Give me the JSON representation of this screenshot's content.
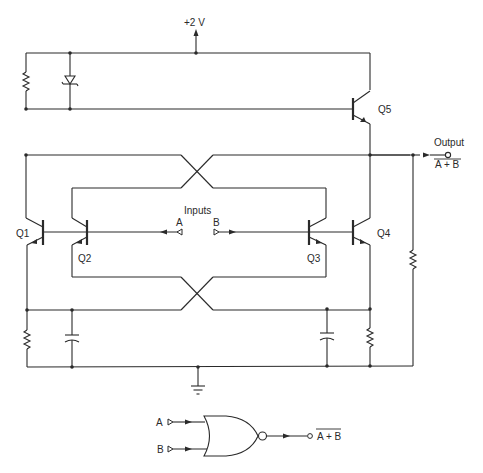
{
  "diagram": {
    "type": "circuit-schematic",
    "supply": {
      "label": "+2 V"
    },
    "transistors": [
      {
        "id": "q1",
        "label": "Q1"
      },
      {
        "id": "q2",
        "label": "Q2"
      },
      {
        "id": "q3",
        "label": "Q3"
      },
      {
        "id": "q4",
        "label": "Q4"
      },
      {
        "id": "q5",
        "label": "Q5"
      }
    ],
    "inputs": {
      "title": "Inputs",
      "a_label": "A",
      "b_label": "B"
    },
    "output": {
      "title": "Output",
      "expression": "A + B",
      "overbar": true
    },
    "components": {
      "resistors": 4,
      "capacitors": 2,
      "diodes": 1,
      "ground": 1
    },
    "logic_symbol": {
      "gate": "NOR",
      "input_a": "A",
      "input_b": "B",
      "output_expression": "A + B",
      "overbar": true
    }
  }
}
